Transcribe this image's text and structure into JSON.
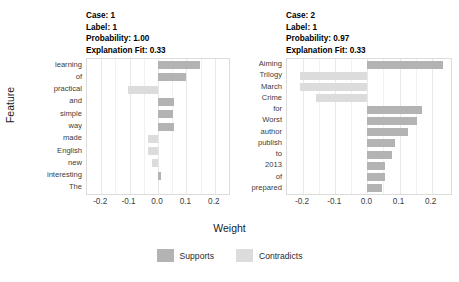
{
  "axes": {
    "ylabel": "Feature",
    "xlabel": "Weight"
  },
  "legend": {
    "items": [
      {
        "label": "Supports",
        "color": "#b3b3b3"
      },
      {
        "label": "Contradicts",
        "color": "#dcdcdc"
      }
    ]
  },
  "panels": [
    {
      "header": {
        "case": "Case: 1",
        "label": "Label: 1",
        "probability": "Probability: 1.00",
        "fit": "Explanation Fit: 0.33"
      },
      "xticks": [
        "-0.2",
        "-0.1",
        "0.0",
        "0.1",
        "0.2"
      ]
    },
    {
      "header": {
        "case": "Case: 2",
        "label": "Label: 1",
        "probability": "Probability: 0.97",
        "fit": "Explanation Fit: 0.33"
      },
      "xticks": [
        "-0.2",
        "-0.1",
        "0.0",
        "0.1",
        "0.2"
      ]
    }
  ],
  "chart_data": [
    {
      "type": "bar",
      "orientation": "horizontal",
      "title": "Case: 1",
      "subtitle": "Label: 1 | Probability: 1.00 | Explanation Fit: 0.33",
      "xlabel": "Weight",
      "ylabel": "Feature",
      "xlim": [
        -0.25,
        0.25
      ],
      "xticks": [
        -0.2,
        -0.1,
        0.0,
        0.1,
        0.2
      ],
      "grid": true,
      "legend_position": "bottom",
      "categories": [
        "learning",
        "of",
        "practical",
        "and",
        "simple",
        "way",
        "made",
        "English",
        "new",
        "interesting",
        "The"
      ],
      "values": [
        0.147,
        0.1,
        -0.105,
        0.055,
        0.052,
        0.055,
        -0.035,
        -0.034,
        -0.02,
        0.012,
        0.0
      ],
      "bar_classes": [
        "Supports",
        "Supports",
        "Contradicts",
        "Supports",
        "Supports",
        "Supports",
        "Contradicts",
        "Contradicts",
        "Contradicts",
        "Supports",
        "Supports"
      ]
    },
    {
      "type": "bar",
      "orientation": "horizontal",
      "title": "Case: 2",
      "subtitle": "Label: 1 | Probability: 0.97 | Explanation Fit: 0.33",
      "xlabel": "Weight",
      "ylabel": "Feature",
      "xlim": [
        -0.25,
        0.26
      ],
      "xticks": [
        -0.2,
        -0.1,
        0.0,
        0.1,
        0.2
      ],
      "grid": true,
      "legend_position": "bottom",
      "categories": [
        "Aiming",
        "Trilogy",
        "March",
        "Crime",
        "for",
        "Worst",
        "author",
        "publish",
        "to",
        "2013",
        "of",
        "prepared"
      ],
      "values": [
        0.236,
        -0.21,
        -0.21,
        -0.16,
        0.17,
        0.155,
        0.125,
        0.085,
        0.075,
        0.055,
        0.055,
        0.045
      ],
      "bar_classes": [
        "Supports",
        "Contradicts",
        "Contradicts",
        "Contradicts",
        "Supports",
        "Supports",
        "Supports",
        "Supports",
        "Supports",
        "Supports",
        "Supports",
        "Supports"
      ]
    }
  ]
}
